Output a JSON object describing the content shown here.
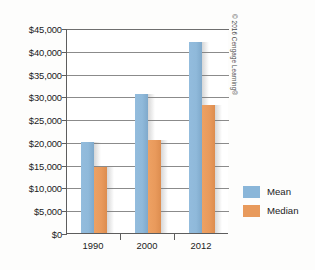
{
  "credit": {
    "text": "© 2016 Cengage Learning®"
  },
  "legend": {
    "items": [
      {
        "label": "Mean",
        "color": "#8ab6d9",
        "key": "mean"
      },
      {
        "label": "Median",
        "color": "#e89a5c",
        "key": "median"
      }
    ]
  },
  "axes": {
    "y_tick_labels": [
      "$45,000",
      "$40,000",
      "$35,000",
      "$30,000",
      "$25,000",
      "$20,000",
      "$15,000",
      "$10,000",
      "$5,000",
      "$0"
    ],
    "x_tick_labels": [
      "1990",
      "2000",
      "2012"
    ]
  },
  "chart_data": {
    "type": "bar",
    "title": "",
    "xlabel": "",
    "ylabel": "",
    "categories": [
      "1990",
      "2000",
      "2012"
    ],
    "series": [
      {
        "name": "Mean",
        "color": "#8ab6d9",
        "values": [
          20000,
          30500,
          42000
        ]
      },
      {
        "name": "Median",
        "color": "#e89a5c",
        "values": [
          14500,
          20500,
          28000
        ]
      }
    ],
    "ylim": [
      0,
      45000
    ],
    "ytick_step": 5000,
    "ytick_values": [
      0,
      5000,
      10000,
      15000,
      20000,
      25000,
      30000,
      35000,
      40000,
      45000
    ],
    "grid": true,
    "grid_axis": "y",
    "legend_position": "right",
    "value_prefix": "$"
  }
}
